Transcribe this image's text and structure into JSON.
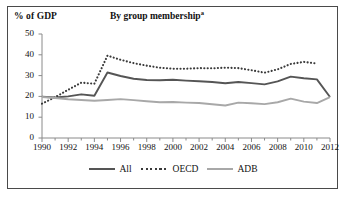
{
  "figure": {
    "axis_unit_label": "% of GDP",
    "title": "By group membership",
    "title_superscript": "a"
  },
  "legend": {
    "position": "bottom-center",
    "items": [
      {
        "label": "All",
        "style": "solid",
        "color": "#555555",
        "icon": "solid-line-icon"
      },
      {
        "label": "OECD",
        "style": "dotted",
        "color": "#3a3a3a",
        "icon": "dotted-line-icon"
      },
      {
        "label": "ADB",
        "style": "solid",
        "color": "#a8a8a8",
        "icon": "solid-line-icon"
      }
    ]
  },
  "chart_data": {
    "type": "line",
    "title": "By group membership",
    "xlabel": "",
    "ylabel": "% of GDP",
    "ylim": [
      0,
      50
    ],
    "xlim": [
      1990,
      2012
    ],
    "yticks": [
      0,
      10,
      20,
      30,
      40,
      50
    ],
    "xticks": [
      1990,
      1992,
      1994,
      1996,
      1998,
      2000,
      2002,
      2004,
      2006,
      2008,
      2010,
      2012
    ],
    "x_minor_tick_step": 1,
    "grid": false,
    "x": [
      1990,
      1991,
      1992,
      1993,
      1994,
      1995,
      1996,
      1997,
      1998,
      1999,
      2000,
      2001,
      2002,
      2003,
      2004,
      2005,
      2006,
      2007,
      2008,
      2009,
      2010,
      2011,
      2012
    ],
    "series": [
      {
        "name": "All",
        "color": "#555555",
        "style": "solid",
        "values": [
          19.8,
          19.5,
          20.0,
          21.0,
          20.3,
          31.5,
          29.8,
          28.5,
          27.9,
          27.8,
          28.0,
          27.6,
          27.3,
          26.9,
          26.3,
          26.9,
          26.4,
          25.8,
          27.2,
          29.5,
          28.7,
          28.2,
          19.7
        ]
      },
      {
        "name": "OECD",
        "color": "#3a3a3a",
        "style": "dotted",
        "values": [
          16.5,
          19.6,
          23.2,
          26.6,
          26.1,
          39.6,
          37.6,
          36.0,
          34.8,
          33.8,
          33.3,
          33.3,
          33.6,
          33.5,
          33.8,
          33.6,
          32.6,
          31.4,
          33.0,
          35.6,
          36.6,
          35.8,
          null
        ]
      },
      {
        "name": "ADB",
        "color": "#a8a8a8",
        "style": "solid",
        "values": [
          19.7,
          19.2,
          18.6,
          18.3,
          17.9,
          18.3,
          18.7,
          18.2,
          17.7,
          17.2,
          17.3,
          17.0,
          16.8,
          16.2,
          15.6,
          17.0,
          16.7,
          16.3,
          17.2,
          18.9,
          17.5,
          16.8,
          19.7
        ]
      }
    ]
  }
}
